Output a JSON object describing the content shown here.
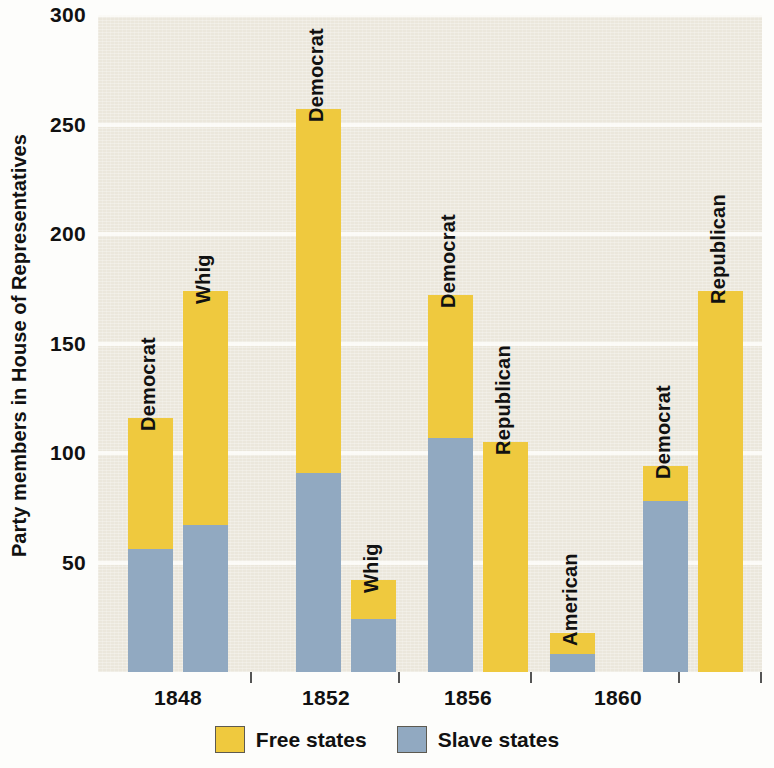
{
  "chart_data": {
    "type": "bar",
    "title": "",
    "subtitle": "",
    "xlabel": "",
    "ylabel": "Party members in House of Representatives",
    "ylim": [
      0,
      300
    ],
    "yticks": [
      50,
      100,
      150,
      200,
      250,
      300
    ],
    "grid": true,
    "stacked": true,
    "legend_position": "bottom",
    "legend": [
      "Free states",
      "Slave states"
    ],
    "series": [
      {
        "name": "Free states",
        "color": "#efc93e"
      },
      {
        "name": "Slave states",
        "color": "#91a9c1"
      }
    ],
    "categories": [
      "1848",
      "1852",
      "1856",
      "1860"
    ],
    "bars": [
      {
        "year": "1848",
        "party": "Democrat",
        "free": 60,
        "slave": 56,
        "total": 116
      },
      {
        "year": "1848",
        "party": "Whig",
        "free": 107,
        "slave": 67,
        "total": 174
      },
      {
        "year": "1852",
        "party": "Democrat",
        "free": 166,
        "slave": 91,
        "total": 257
      },
      {
        "year": "1852",
        "party": "Whig",
        "free": 18,
        "slave": 24,
        "total": 42
      },
      {
        "year": "1856",
        "party": "Democrat",
        "free": 65,
        "slave": 107,
        "total": 172
      },
      {
        "year": "1856",
        "party": "Republican",
        "free": 105,
        "slave": 0,
        "total": 105
      },
      {
        "year": "1856",
        "party": "American",
        "free": 10,
        "slave": 8,
        "total": 18
      },
      {
        "year": "1860",
        "party": "Democrat",
        "free": 16,
        "slave": 78,
        "total": 94
      },
      {
        "year": "1860",
        "party": "Republican",
        "free": 174,
        "slave": 0,
        "total": 174
      }
    ]
  },
  "colors": {
    "free_states": "#efc93e",
    "slave_states": "#91a9c1",
    "plot_background": "#ebe7dc",
    "gridline": "#fbfaf6",
    "page_background": "#fdfdfb",
    "text": "#111111"
  }
}
